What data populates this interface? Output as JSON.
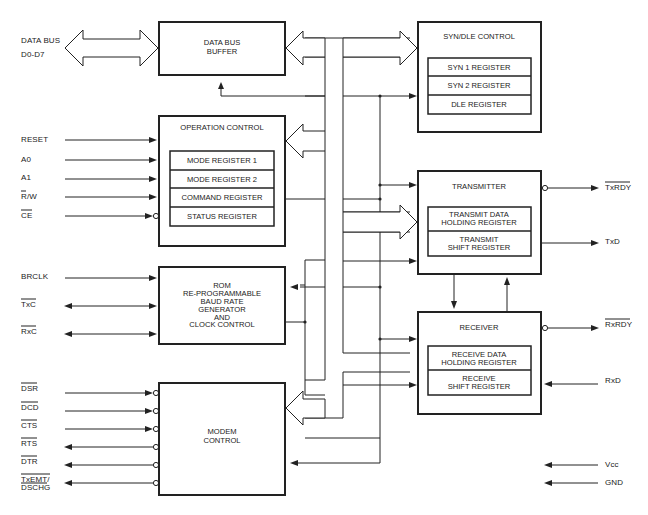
{
  "diagram": {
    "type": "block-diagram",
    "colors": {
      "ink": "#222222",
      "background": "#ffffff"
    }
  },
  "pins_left": {
    "data_bus": {
      "line1": "DATA BUS",
      "line2": "D0-D7"
    },
    "reset": "RESET",
    "a0": "A0",
    "a1": "A1",
    "rw": "R/W",
    "ce": "CE",
    "brclk": "BRCLK",
    "txc": "TxC",
    "rxc": "RxC",
    "dsr": "DSR",
    "dcd": "DCD",
    "cts": "CTS",
    "rts": "RTS",
    "dtr": "DTR",
    "txemt": {
      "line1": "TxEMT/",
      "line2": "DSCHG"
    }
  },
  "pins_right": {
    "txrdy": "TxRDY",
    "txd": "TxD",
    "rxrdy": "RxRDY",
    "rxd": "RxD",
    "vcc": "Vcc",
    "gnd": "GND"
  },
  "blocks": {
    "data_bus_buffer": {
      "line1": "DATA BUS",
      "line2": "BUFFER"
    },
    "operation_control": {
      "title": "OPERATION CONTROL",
      "registers": [
        "MODE REGISTER 1",
        "MODE REGISTER 2",
        "COMMAND REGISTER",
        "STATUS REGISTER"
      ]
    },
    "baud_rate_generator": {
      "lines": [
        "ROM",
        "RE-PROGRAMMABLE",
        "BAUD RATE",
        "GENERATOR",
        "AND",
        "CLOCK CONTROL"
      ]
    },
    "modem_control": {
      "line1": "MODEM",
      "line2": "CONTROL"
    },
    "syn_dle_control": {
      "title": "SYN/DLE CONTROL",
      "registers": [
        "SYN 1 REGISTER",
        "SYN 2 REGISTER",
        "DLE REGISTER"
      ]
    },
    "transmitter": {
      "title": "TRANSMITTER",
      "registers": [
        {
          "line1": "TRANSMIT DATA",
          "line2": "HOLDING REGISTER"
        },
        {
          "line1": "TRANSMIT",
          "line2": "SHIFT REGISTER"
        }
      ]
    },
    "receiver": {
      "title": "RECEIVER",
      "registers": [
        {
          "line1": "RECEIVE DATA",
          "line2": "HOLDING REGISTER"
        },
        {
          "line1": "RECEIVE",
          "line2": "SHIFT REGISTER"
        }
      ]
    }
  }
}
